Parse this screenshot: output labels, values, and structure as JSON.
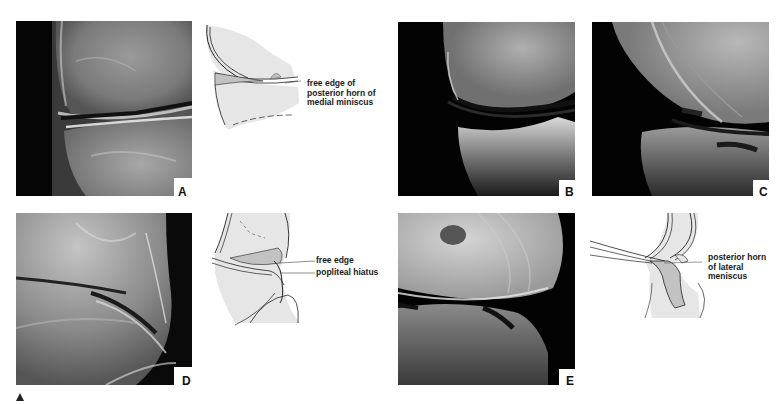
{
  "figure": {
    "panels": [
      {
        "id": "A",
        "label": "A",
        "type": "radiograph"
      },
      {
        "id": "B",
        "label": "B",
        "type": "radiograph"
      },
      {
        "id": "C",
        "label": "C",
        "type": "radiograph"
      },
      {
        "id": "D",
        "label": "D",
        "type": "radiograph"
      },
      {
        "id": "E",
        "label": "E",
        "type": "radiograph"
      }
    ],
    "drawings": [
      {
        "id": "A-drawing",
        "callouts": [
          {
            "lines": [
              "free edge of",
              "posterior horn of",
              "medial miniscus"
            ]
          }
        ]
      },
      {
        "id": "D-drawing",
        "callouts": [
          {
            "lines": [
              "free edge"
            ]
          },
          {
            "lines": [
              "popliteal hiatus"
            ]
          }
        ]
      },
      {
        "id": "E-drawing",
        "callouts": [
          {
            "lines": [
              "posterior horn",
              "of lateral",
              "meniscus"
            ]
          }
        ]
      }
    ],
    "marker": {
      "icon": "triangle-up-icon",
      "color": "#222222"
    },
    "colors": {
      "drawing_fill": "#e6e6e6",
      "meniscus_fill": "#c2c2c2",
      "line": "#222222",
      "background": "#ffffff"
    }
  }
}
